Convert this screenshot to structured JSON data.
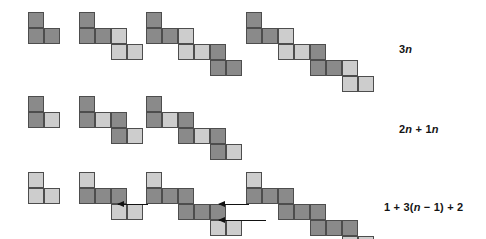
{
  "figure": {
    "colors": {
      "dark": "#8a8a8a",
      "light": "#cdcdcd",
      "cell_border": "#4d4d4d",
      "arrow": "#111111",
      "background": "#ffffff"
    },
    "cell_size_px": 16,
    "rows": [
      {
        "id": "row-1",
        "label": "3n",
        "label_html": "3<i>n</i>",
        "label_x": 399,
        "label_y": 43,
        "top": 12,
        "figures": [
          {
            "id": "row1-fig1",
            "left": 28,
            "term": 1,
            "cells": [
              {
                "c": 0,
                "r": 0,
                "shade": "dark"
              },
              {
                "c": 0,
                "r": 1,
                "shade": "dark"
              },
              {
                "c": 1,
                "r": 1,
                "shade": "dark"
              }
            ]
          },
          {
            "id": "row1-fig2",
            "left": 79,
            "term": 2,
            "cells": [
              {
                "c": 0,
                "r": 0,
                "shade": "dark"
              },
              {
                "c": 0,
                "r": 1,
                "shade": "dark"
              },
              {
                "c": 1,
                "r": 1,
                "shade": "dark"
              },
              {
                "c": 2,
                "r": 1,
                "shade": "light"
              },
              {
                "c": 2,
                "r": 2,
                "shade": "light"
              },
              {
                "c": 3,
                "r": 2,
                "shade": "light"
              }
            ]
          },
          {
            "id": "row1-fig3",
            "left": 146,
            "term": 3,
            "cells": [
              {
                "c": 0,
                "r": 0,
                "shade": "dark"
              },
              {
                "c": 0,
                "r": 1,
                "shade": "dark"
              },
              {
                "c": 1,
                "r": 1,
                "shade": "dark"
              },
              {
                "c": 2,
                "r": 1,
                "shade": "light"
              },
              {
                "c": 2,
                "r": 2,
                "shade": "light"
              },
              {
                "c": 3,
                "r": 2,
                "shade": "light"
              },
              {
                "c": 4,
                "r": 2,
                "shade": "dark"
              },
              {
                "c": 4,
                "r": 3,
                "shade": "dark"
              },
              {
                "c": 5,
                "r": 3,
                "shade": "dark"
              }
            ]
          },
          {
            "id": "row1-fig4",
            "left": 246,
            "term": 4,
            "cells": [
              {
                "c": 0,
                "r": 0,
                "shade": "dark"
              },
              {
                "c": 0,
                "r": 1,
                "shade": "dark"
              },
              {
                "c": 1,
                "r": 1,
                "shade": "dark"
              },
              {
                "c": 2,
                "r": 1,
                "shade": "light"
              },
              {
                "c": 2,
                "r": 2,
                "shade": "light"
              },
              {
                "c": 3,
                "r": 2,
                "shade": "light"
              },
              {
                "c": 4,
                "r": 2,
                "shade": "dark"
              },
              {
                "c": 4,
                "r": 3,
                "shade": "dark"
              },
              {
                "c": 5,
                "r": 3,
                "shade": "dark"
              },
              {
                "c": 6,
                "r": 3,
                "shade": "light"
              },
              {
                "c": 6,
                "r": 4,
                "shade": "light"
              },
              {
                "c": 7,
                "r": 4,
                "shade": "light"
              }
            ]
          }
        ],
        "arrows": []
      },
      {
        "id": "row-2",
        "label": "2n + 1n",
        "label_html": "2<i>n</i> + 1<i>n</i>",
        "label_x": 399,
        "label_y": 123,
        "top": 96,
        "figures": [
          {
            "id": "row2-fig1",
            "left": 28,
            "term": 1,
            "cells": [
              {
                "c": 0,
                "r": 0,
                "shade": "dark"
              },
              {
                "c": 0,
                "r": 1,
                "shade": "dark"
              },
              {
                "c": 1,
                "r": 1,
                "shade": "light"
              }
            ]
          },
          {
            "id": "row2-fig2",
            "left": 79,
            "term": 2,
            "cells": [
              {
                "c": 0,
                "r": 0,
                "shade": "dark"
              },
              {
                "c": 0,
                "r": 1,
                "shade": "dark"
              },
              {
                "c": 1,
                "r": 1,
                "shade": "light"
              },
              {
                "c": 2,
                "r": 1,
                "shade": "dark"
              },
              {
                "c": 2,
                "r": 2,
                "shade": "dark"
              },
              {
                "c": 3,
                "r": 2,
                "shade": "light"
              }
            ]
          },
          {
            "id": "row2-fig3",
            "left": 146,
            "term": 3,
            "cells": [
              {
                "c": 0,
                "r": 0,
                "shade": "dark"
              },
              {
                "c": 0,
                "r": 1,
                "shade": "dark"
              },
              {
                "c": 1,
                "r": 1,
                "shade": "light"
              },
              {
                "c": 2,
                "r": 1,
                "shade": "dark"
              },
              {
                "c": 2,
                "r": 2,
                "shade": "dark"
              },
              {
                "c": 3,
                "r": 2,
                "shade": "light"
              },
              {
                "c": 4,
                "r": 2,
                "shade": "dark"
              },
              {
                "c": 4,
                "r": 3,
                "shade": "dark"
              },
              {
                "c": 5,
                "r": 3,
                "shade": "light"
              }
            ]
          }
        ],
        "arrows": []
      },
      {
        "id": "row-3",
        "label": "1 + 3(n − 1) + 2",
        "label_html": "1 + 3(<i>n</i> − 1) + 2",
        "label_x": 384,
        "label_y": 201,
        "top": 172,
        "figures": [
          {
            "id": "row3-fig1",
            "left": 28,
            "term": 1,
            "cells": [
              {
                "c": 0,
                "r": 0,
                "shade": "light"
              },
              {
                "c": 0,
                "r": 1,
                "shade": "light"
              },
              {
                "c": 1,
                "r": 1,
                "shade": "light"
              }
            ]
          },
          {
            "id": "row3-fig2",
            "left": 79,
            "term": 2,
            "cells": [
              {
                "c": 0,
                "r": 0,
                "shade": "light"
              },
              {
                "c": 0,
                "r": 1,
                "shade": "dark"
              },
              {
                "c": 1,
                "r": 1,
                "shade": "dark"
              },
              {
                "c": 2,
                "r": 1,
                "shade": "dark"
              },
              {
                "c": 2,
                "r": 2,
                "shade": "light"
              },
              {
                "c": 3,
                "r": 2,
                "shade": "light"
              }
            ]
          },
          {
            "id": "row3-fig3",
            "left": 146,
            "term": 3,
            "cells": [
              {
                "c": 0,
                "r": 0,
                "shade": "light"
              },
              {
                "c": 0,
                "r": 1,
                "shade": "dark"
              },
              {
                "c": 1,
                "r": 1,
                "shade": "dark"
              },
              {
                "c": 2,
                "r": 1,
                "shade": "dark"
              },
              {
                "c": 2,
                "r": 2,
                "shade": "dark"
              },
              {
                "c": 3,
                "r": 2,
                "shade": "dark"
              },
              {
                "c": 4,
                "r": 2,
                "shade": "dark"
              },
              {
                "c": 4,
                "r": 3,
                "shade": "light"
              },
              {
                "c": 5,
                "r": 3,
                "shade": "light"
              }
            ]
          },
          {
            "id": "row3-fig4",
            "left": 246,
            "term": 4,
            "cells": [
              {
                "c": 0,
                "r": 0,
                "shade": "light"
              },
              {
                "c": 0,
                "r": 1,
                "shade": "dark"
              },
              {
                "c": 1,
                "r": 1,
                "shade": "dark"
              },
              {
                "c": 2,
                "r": 1,
                "shade": "dark"
              },
              {
                "c": 2,
                "r": 2,
                "shade": "dark"
              },
              {
                "c": 3,
                "r": 2,
                "shade": "dark"
              },
              {
                "c": 4,
                "r": 2,
                "shade": "dark"
              },
              {
                "c": 4,
                "r": 3,
                "shade": "dark"
              },
              {
                "c": 5,
                "r": 3,
                "shade": "dark"
              },
              {
                "c": 6,
                "r": 3,
                "shade": "dark"
              },
              {
                "c": 6,
                "r": 4,
                "shade": "light"
              },
              {
                "c": 7,
                "r": 4,
                "shade": "light"
              }
            ]
          }
        ],
        "arrows": [
          {
            "id": "row3-arrow-1",
            "x": 118,
            "y": 204,
            "length": 30,
            "direction": "left"
          },
          {
            "id": "row3-arrow-2",
            "x": 219,
            "y": 204,
            "length": 30,
            "direction": "left"
          },
          {
            "id": "row3-arrow-3",
            "x": 219,
            "y": 220,
            "length": 47,
            "direction": "left"
          }
        ]
      }
    ]
  }
}
